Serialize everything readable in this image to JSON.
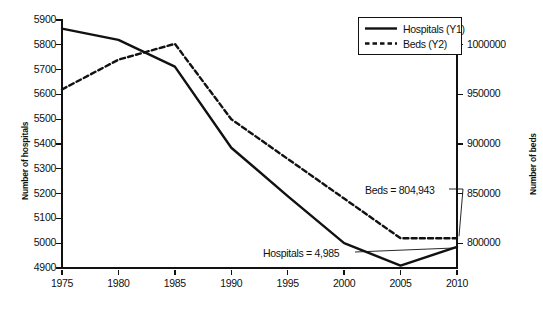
{
  "chart_data": {
    "type": "line",
    "title": "",
    "subtitle": "",
    "xlabel": "",
    "ylabel": "Number of hospitals",
    "y2label": "Number of beds",
    "x": [
      1975,
      1980,
      1985,
      1990,
      1995,
      2000,
      2005,
      2010
    ],
    "xticklabels": [
      "1975",
      "1980",
      "1985",
      "1990",
      "1995",
      "2000",
      "2005",
      "2010"
    ],
    "xlim": [
      1975,
      2010
    ],
    "ylim": [
      4900,
      5900
    ],
    "yticks": [
      4900,
      5000,
      5100,
      5200,
      5300,
      5400,
      5500,
      5600,
      5700,
      5800,
      5900
    ],
    "yticklabels": [
      "4900",
      "5000",
      "5100",
      "5200",
      "5300",
      "5400",
      "5500",
      "5600",
      "5700",
      "5800",
      "5900"
    ],
    "y2lim": [
      775000,
      1025000
    ],
    "y2ticks": [
      800000,
      850000,
      900000,
      950000,
      1000000
    ],
    "y2ticklabels": [
      "800000",
      "850000",
      "900000",
      "950000",
      "1000000"
    ],
    "grid": false,
    "legend_position": "top-right",
    "series": [
      {
        "name": "Hospitals (Y1)",
        "axis": "y1",
        "style": "solid",
        "color": "#111111",
        "values": [
          5865,
          5820,
          5712,
          5385,
          5190,
          5000,
          4910,
          4985
        ]
      },
      {
        "name": "Beds (Y2)",
        "axis": "y2",
        "style": "dashed",
        "color": "#111111",
        "values": [
          955000,
          985000,
          1001000,
          925000,
          885000,
          845000,
          805000,
          804943
        ]
      }
    ],
    "annotations": [
      {
        "text": "Beds = 804,943",
        "points_to_x": 2010,
        "points_to_series": "Beds (Y2)"
      },
      {
        "text": "Hospitals = 4,985",
        "points_to_x": 2010,
        "points_to_series": "Hospitals (Y1)"
      }
    ]
  },
  "legend": {
    "items": [
      {
        "label": "Hospitals (Y1)",
        "style": "solid"
      },
      {
        "label": "Beds (Y2)",
        "style": "dashed"
      }
    ]
  }
}
